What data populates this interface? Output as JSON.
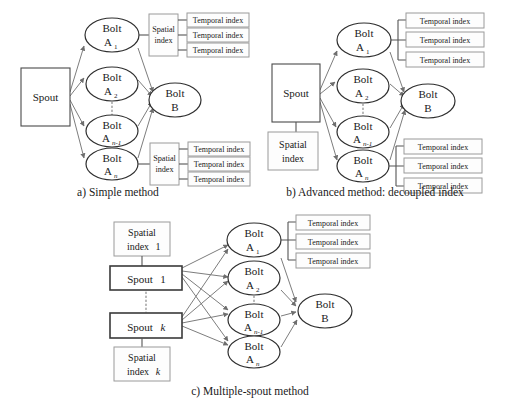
{
  "figure": {
    "panels": [
      {
        "id": "a",
        "caption": "a) Simple method",
        "spout": "Spout",
        "sink_bolt": {
          "line1": "Bolt",
          "line2": "B"
        },
        "bolts": [
          {
            "line1": "Bolt",
            "label": "A",
            "sub": "1"
          },
          {
            "line1": "Bolt",
            "label": "A",
            "sub": "2"
          },
          {
            "line1": "Bolt",
            "label": "A",
            "sub": "n-1"
          },
          {
            "line1": "Bolt",
            "label": "A",
            "sub": "n"
          }
        ],
        "spatial_index_label": {
          "line1": "Spatial",
          "line2": "index"
        },
        "spatial_index_count": 2,
        "temporal_index_label": "Temporal index",
        "temporal_per_group": 3
      },
      {
        "id": "b",
        "caption": "b) Advanced method: decoupled index",
        "spout": "Spout",
        "sink_bolt": {
          "line1": "Bolt",
          "line2": "B"
        },
        "bolts": [
          {
            "line1": "Bolt",
            "label": "A",
            "sub": "1"
          },
          {
            "line1": "Bolt",
            "label": "A",
            "sub": "2"
          },
          {
            "line1": "Bolt",
            "label": "A",
            "sub": "n-1"
          },
          {
            "line1": "Bolt",
            "label": "A",
            "sub": "n"
          }
        ],
        "spatial_index_label": {
          "line1": "Spatial",
          "line2": "index"
        },
        "spatial_index_count": 1,
        "temporal_index_label": "Temporal index",
        "temporal_per_group": 3
      },
      {
        "id": "c",
        "caption": "c) Multiple-spout method",
        "spouts": [
          {
            "text": "Spout",
            "suffix": "1"
          },
          {
            "text": "Spout",
            "suffix": "k"
          }
        ],
        "spatial_indexes": [
          {
            "line1": "Spatial",
            "line2": "index",
            "suffix": "1"
          },
          {
            "line1": "Spatial",
            "line2": "index",
            "suffix": "k"
          }
        ],
        "sink_bolt": {
          "line1": "Bolt",
          "line2": "B"
        },
        "bolts": [
          {
            "line1": "Bolt",
            "label": "A",
            "sub": "1"
          },
          {
            "line1": "Bolt",
            "label": "A",
            "sub": "2"
          },
          {
            "line1": "Bolt",
            "label": "A",
            "sub": "n-1"
          },
          {
            "line1": "Bolt",
            "label": "A",
            "sub": "n"
          }
        ],
        "temporal_index_label": "Temporal index",
        "temporal_per_group": 3
      }
    ],
    "colors": {
      "background": "#ffffff",
      "node_stroke": "#2f2f2f",
      "index_stroke": "#9a9a9a",
      "edge": "#7d7d7d",
      "text": "#1a1a1a"
    }
  }
}
